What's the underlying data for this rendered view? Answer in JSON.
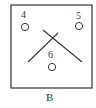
{
  "diagram": {
    "caption": "B",
    "points": [
      {
        "label": "4",
        "cx": 25,
        "cy": 27
      },
      {
        "label": "5",
        "cx": 79,
        "cy": 26
      },
      {
        "label": "6",
        "cx": 52,
        "cy": 67
      }
    ],
    "lines": [
      {
        "x1": 28,
        "y1": 62,
        "x2": 58,
        "y2": 33
      },
      {
        "x1": 43,
        "y1": 30,
        "x2": 82,
        "y2": 62
      }
    ],
    "colors": {
      "stroke": "#333333",
      "background": "#ffffff"
    }
  }
}
